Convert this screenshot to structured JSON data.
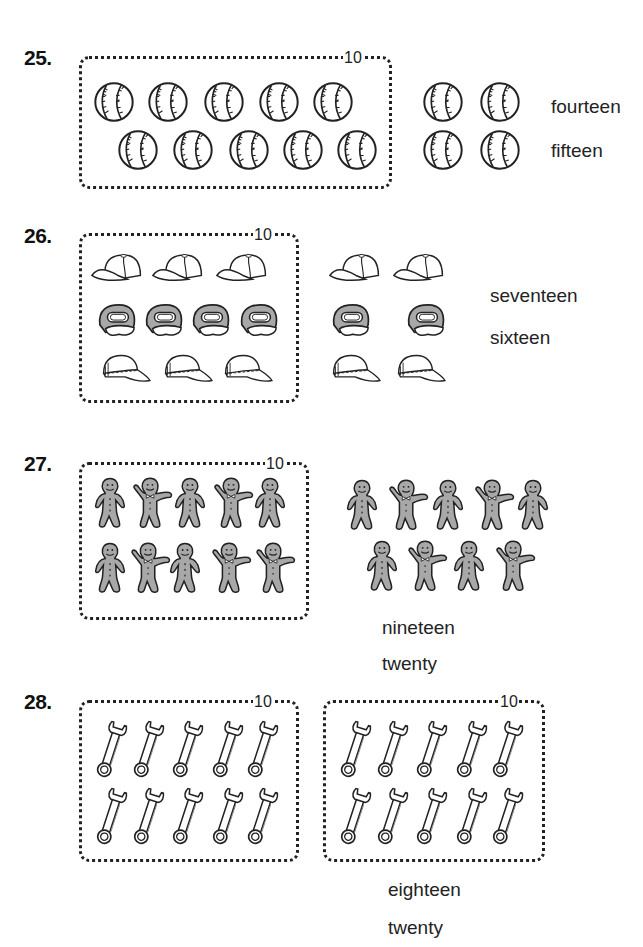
{
  "problems": [
    {
      "number": "25.",
      "object": "baseball",
      "box_label": "10",
      "boxed_count": 10,
      "extra_count": 4,
      "choices": [
        "fourteen",
        "fifteen"
      ]
    },
    {
      "number": "26.",
      "object": "cap",
      "box_label": "10",
      "boxed_count": 10,
      "extra_count": 6,
      "choices": [
        "seventeen",
        "sixteen"
      ]
    },
    {
      "number": "27.",
      "object": "gingerbread-man",
      "box_label": "10",
      "boxed_count": 10,
      "extra_count": 9,
      "choices": [
        "nineteen",
        "twenty"
      ]
    },
    {
      "number": "28.",
      "object": "wrench",
      "box_label": "10",
      "boxed_count": 10,
      "second_box_label": "10",
      "extra_count": 10,
      "choices": [
        "eighteen",
        "twenty"
      ]
    }
  ],
  "colors": {
    "ink": "#222222",
    "fill_gray": "#a8a8a8",
    "background": "#ffffff"
  }
}
